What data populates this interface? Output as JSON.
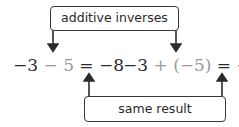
{
  "top_label": "additive inverses",
  "bottom_label": "same result",
  "left_equation": {
    "first": "−3",
    "op": "−",
    "operand": "5",
    "equals": "=",
    "result": "−8"
  },
  "right_equation": {
    "first": "−3",
    "op": "+",
    "operand": "(−5)",
    "equals": "=",
    "result": "−8"
  },
  "colors": {
    "main": "#2a2a2a",
    "highlight": "#9a9a9a",
    "stroke": "#3a3a3a"
  }
}
